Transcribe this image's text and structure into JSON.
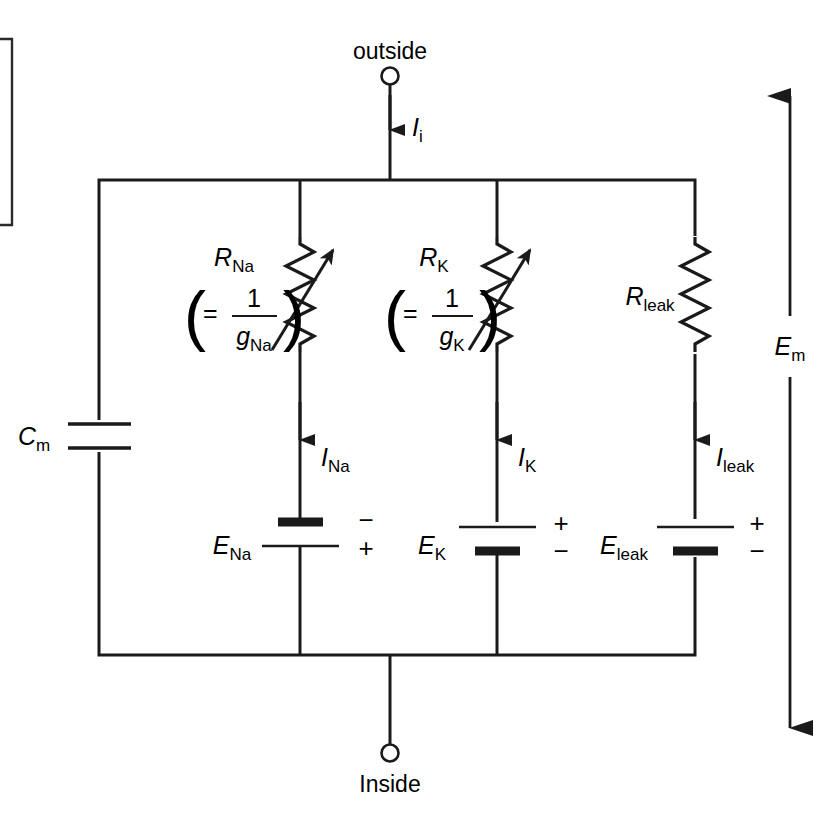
{
  "figure": {
    "type": "electrical-circuit-diagram",
    "title_visible": false,
    "ink_color": "#1a1a1a",
    "background_color": "#ffffff"
  },
  "terminals": {
    "top": {
      "label": "outside",
      "marker": "open-circle"
    },
    "bottom": {
      "label": "Inside",
      "marker": "open-circle"
    }
  },
  "currents": {
    "input": {
      "symbol": "I",
      "subscript": "i"
    },
    "sodium": {
      "symbol": "I",
      "subscript": "Na"
    },
    "potassium": {
      "symbol": "I",
      "subscript": "K"
    },
    "leak": {
      "symbol": "I",
      "subscript": "leak"
    }
  },
  "capacitor": {
    "symbol": "C",
    "subscript": "m"
  },
  "resistors": {
    "sodium": {
      "symbol": "R",
      "subscript": "Na",
      "variable": true,
      "relation": {
        "equals": "=",
        "numerator": "1",
        "denominator_symbol": "g",
        "denominator_subscript": "Na",
        "open_paren": "(",
        "close_paren": ")"
      }
    },
    "potassium": {
      "symbol": "R",
      "subscript": "K",
      "variable": true,
      "relation": {
        "equals": "=",
        "numerator": "1",
        "denominator_symbol": "g",
        "denominator_subscript": "K",
        "open_paren": "(",
        "close_paren": ")"
      }
    },
    "leak": {
      "symbol": "R",
      "subscript": "leak",
      "variable": false,
      "relation": null
    }
  },
  "batteries": {
    "sodium": {
      "symbol": "E",
      "subscript": "Na",
      "top_sign": "−",
      "bottom_sign": "+",
      "thick_plate": "top"
    },
    "potassium": {
      "symbol": "E",
      "subscript": "K",
      "top_sign": "+",
      "bottom_sign": "−",
      "thick_plate": "bottom"
    },
    "leak": {
      "symbol": "E",
      "subscript": "leak",
      "top_sign": "+",
      "bottom_sign": "−",
      "thick_plate": "bottom"
    }
  },
  "membrane_potential": {
    "symbol": "E",
    "subscript": "m",
    "arrow": "double-headed-vertical"
  }
}
